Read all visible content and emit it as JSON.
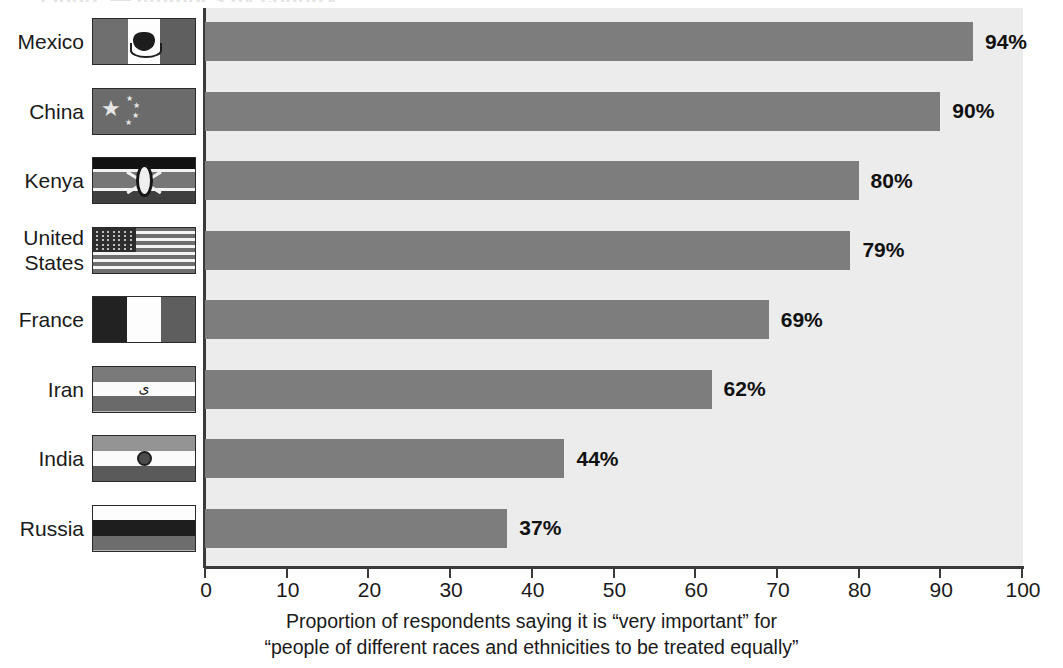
{
  "title_remnant": "Figure — attitudes by country",
  "chart_data": {
    "type": "bar",
    "orientation": "horizontal",
    "title": "",
    "xlabel": "Proportion of respondents saying it is “very important” for “people of different races and ethnicities to be treated equally”",
    "ylabel": "",
    "xlim": [
      0,
      100
    ],
    "xticks": [
      0,
      10,
      20,
      30,
      40,
      50,
      60,
      70,
      80,
      90,
      100
    ],
    "grid": false,
    "legend": "none",
    "bar_color": "#7d7d7d",
    "plot_background": "#ececec",
    "categories": [
      "Mexico",
      "China",
      "Kenya",
      "United States",
      "France",
      "Iran",
      "India",
      "Russia"
    ],
    "values": [
      94,
      90,
      80,
      79,
      69,
      62,
      44,
      37
    ],
    "value_labels": [
      "94%",
      "90%",
      "80%",
      "79%",
      "69%",
      "62%",
      "44%",
      "37%"
    ]
  },
  "rows": [
    {
      "label": "Mexico",
      "flag": "mexico-flag",
      "value": 94,
      "value_label": "94%"
    },
    {
      "label": "China",
      "flag": "china-flag",
      "value": 90,
      "value_label": "90%"
    },
    {
      "label": "Kenya",
      "flag": "kenya-flag",
      "value": 80,
      "value_label": "80%"
    },
    {
      "label": "United\nStates",
      "flag": "united-states-flag",
      "value": 79,
      "value_label": "79%"
    },
    {
      "label": "France",
      "flag": "france-flag",
      "value": 69,
      "value_label": "69%"
    },
    {
      "label": "Iran",
      "flag": "iran-flag",
      "value": 62,
      "value_label": "62%"
    },
    {
      "label": "India",
      "flag": "india-flag",
      "value": 44,
      "value_label": "44%"
    },
    {
      "label": "Russia",
      "flag": "russia-flag",
      "value": 37,
      "value_label": "37%"
    }
  ],
  "axis": {
    "ticks": [
      "0",
      "10",
      "20",
      "30",
      "40",
      "50",
      "60",
      "70",
      "80",
      "90",
      "100"
    ]
  },
  "caption": {
    "line1": "Proportion of respondents saying it is “very important” for",
    "line2": "“people of different races and ethnicities to be treated equally”"
  }
}
